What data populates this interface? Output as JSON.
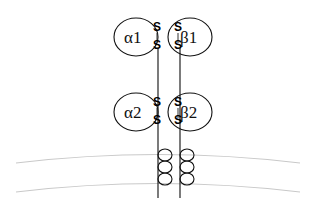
{
  "diagram": {
    "subunits": [
      {
        "id": "alpha1",
        "label": "α1",
        "cx": 136,
        "cy": 37,
        "rx": 22,
        "ry": 19,
        "label_x": 124,
        "label_y": 43
      },
      {
        "id": "beta1",
        "label": "β1",
        "cx": 190,
        "cy": 37,
        "rx": 22,
        "ry": 19,
        "label_x": 180,
        "label_y": 43
      },
      {
        "id": "alpha2",
        "label": "α2",
        "cx": 136,
        "cy": 112,
        "rx": 22,
        "ry": 19,
        "label_x": 124,
        "label_y": 118
      },
      {
        "id": "beta2",
        "label": "β2",
        "cx": 190,
        "cy": 112,
        "rx": 22,
        "ry": 19,
        "label_x": 180,
        "label_y": 118
      }
    ],
    "sulfurs": [
      {
        "id": "s-alpha1-upper",
        "text": "S",
        "x": 153,
        "y": 31
      },
      {
        "id": "s-alpha1-lower",
        "text": "S",
        "x": 153,
        "y": 49
      },
      {
        "id": "s-beta1-upper",
        "text": "S",
        "x": 174,
        "y": 31
      },
      {
        "id": "s-beta1-lower",
        "text": "S",
        "x": 174,
        "y": 49
      },
      {
        "id": "s-alpha2-upper",
        "text": "S",
        "x": 153,
        "y": 106
      },
      {
        "id": "s-alpha2-lower",
        "text": "S",
        "x": 153,
        "y": 124
      },
      {
        "id": "s-beta2-upper",
        "text": "S",
        "x": 174,
        "y": 106
      },
      {
        "id": "s-beta2-lower",
        "text": "S",
        "x": 174,
        "y": 124
      }
    ],
    "disulfide_bonds": [
      {
        "id": "bond-alpha1",
        "x": 157,
        "y1": 33,
        "y2": 43
      },
      {
        "id": "bond-beta1",
        "x": 178,
        "y1": 33,
        "y2": 43
      },
      {
        "id": "bond-alpha2",
        "x": 157,
        "y1": 108,
        "y2": 118
      },
      {
        "id": "bond-beta2",
        "x": 178,
        "y1": 108,
        "y2": 118
      }
    ],
    "chains": [
      {
        "id": "alpha-chain",
        "x": 158,
        "y1": 48,
        "y2": 198
      },
      {
        "id": "beta-chain",
        "x": 180,
        "y1": 48,
        "y2": 198
      }
    ],
    "membrane": {
      "outer_leaflet_path": "M 16 163 Q 158 146 300 163",
      "inner_leaflet_path": "M 16 192 Q 158 175 300 192",
      "color": "#c9c9c9"
    },
    "transmembrane_helices": [
      {
        "id": "alpha-tm-helix",
        "line_x": 158,
        "loops": [
          {
            "cx": 165,
            "cy": 155,
            "rx": 7,
            "ry": 6
          },
          {
            "cx": 165,
            "cy": 167,
            "rx": 7,
            "ry": 6
          },
          {
            "cx": 165,
            "cy": 179,
            "rx": 7,
            "ry": 6
          }
        ]
      },
      {
        "id": "beta-tm-helix",
        "line_x": 180,
        "loops": [
          {
            "cx": 187,
            "cy": 155,
            "rx": 7,
            "ry": 6
          },
          {
            "cx": 187,
            "cy": 167,
            "rx": 7,
            "ry": 6
          },
          {
            "cx": 187,
            "cy": 179,
            "rx": 7,
            "ry": 6
          }
        ]
      }
    ],
    "colors": {
      "outline": "#111111",
      "chain": "#222222",
      "membrane": "#c9c9c9",
      "background": "#ffffff"
    }
  }
}
